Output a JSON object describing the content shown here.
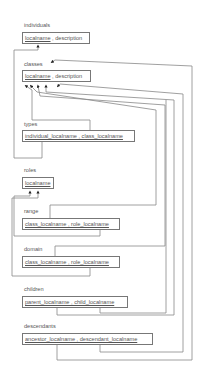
{
  "tables": {
    "individuals": {
      "name": "individuals",
      "columns": [
        "localname",
        "description"
      ],
      "pk": "localname",
      "sep": " , "
    },
    "classes": {
      "name": "classes",
      "columns": [
        "localname",
        "description"
      ],
      "pk": "localname",
      "sep": " , "
    },
    "types": {
      "name": "types",
      "key": "individual_localname , class_localname"
    },
    "roles": {
      "name": "roles",
      "key": "localname"
    },
    "range": {
      "name": "range",
      "key": "class_localname , role_localname"
    },
    "domain": {
      "name": "domain",
      "key": "class_localname , role_localname"
    },
    "children": {
      "name": "children",
      "key": "parent_localname , child_localname"
    },
    "descendants": {
      "name": "descendants",
      "key": "ancestor_localname , descendant_localname"
    }
  },
  "relationships": [
    {
      "from": "types.individual_localname",
      "to": "individuals.localname"
    },
    {
      "from": "types.class_localname",
      "to": "classes.localname"
    },
    {
      "from": "range.class_localname",
      "to": "classes.localname"
    },
    {
      "from": "range.role_localname",
      "to": "roles.localname"
    },
    {
      "from": "domain.class_localname",
      "to": "classes.localname"
    },
    {
      "from": "domain.role_localname",
      "to": "roles.localname"
    },
    {
      "from": "children.parent_localname",
      "to": "classes.localname"
    },
    {
      "from": "children.child_localname",
      "to": "classes.localname"
    },
    {
      "from": "descendants.ancestor_localname",
      "to": "classes.localname"
    },
    {
      "from": "descendants.descendant_localname",
      "to": "classes.localname"
    }
  ]
}
